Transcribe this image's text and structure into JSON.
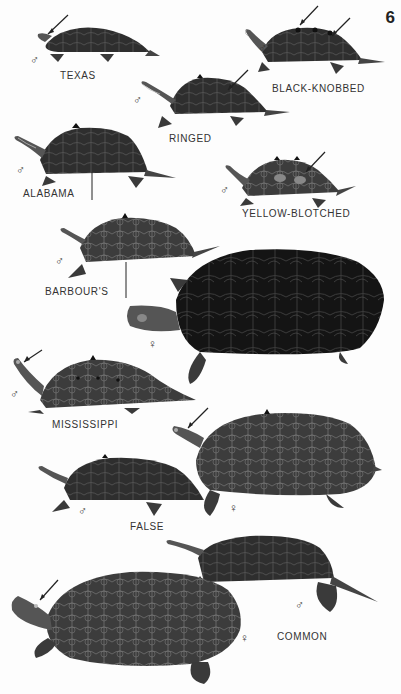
{
  "page": {
    "number": "6",
    "type": "field-guide-plate",
    "background": "#fdfdfd"
  },
  "symbols": {
    "male": "♂",
    "female": "♀"
  },
  "species": [
    {
      "id": "texas",
      "label": "TEXAS",
      "figures": [
        {
          "sex": "male"
        }
      ],
      "pointers": 1
    },
    {
      "id": "black-knobbed",
      "label": "BLACK-KNOBBED",
      "figures": [
        {
          "sex": "male"
        }
      ],
      "pointers": 2
    },
    {
      "id": "ringed",
      "label": "RINGED",
      "figures": [
        {
          "sex": "male"
        }
      ],
      "pointers": 1
    },
    {
      "id": "alabama",
      "label": "ALABAMA",
      "figures": [
        {
          "sex": "male"
        }
      ],
      "pointers": 1
    },
    {
      "id": "yellow-blotched",
      "label": "YELLOW-BLOTCHED",
      "figures": [
        {
          "sex": "male"
        }
      ],
      "pointers": 1
    },
    {
      "id": "barbours",
      "label": "BARBOUR'S",
      "figures": [
        {
          "sex": "male"
        },
        {
          "sex": "female"
        }
      ],
      "pointers": 1
    },
    {
      "id": "mississippi",
      "label": "MISSISSIPPI",
      "figures": [
        {
          "sex": "male"
        }
      ],
      "pointers": 1
    },
    {
      "id": "false",
      "label": "FALSE",
      "figures": [
        {
          "sex": "male"
        },
        {
          "sex": "female"
        }
      ],
      "pointers": 1
    },
    {
      "id": "common",
      "label": "COMMON",
      "figures": [
        {
          "sex": "male"
        },
        {
          "sex": "female"
        }
      ],
      "pointers": 1
    }
  ],
  "colors": {
    "shell_dark": "#1c1c1c",
    "shell_mid": "#3a3a3a",
    "shell_light": "#5a5a5a",
    "skin": "#6a6a6a",
    "stripe": "#b8b8b8",
    "text": "#333333"
  }
}
